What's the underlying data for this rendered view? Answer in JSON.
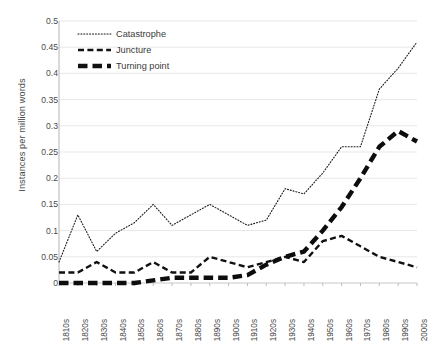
{
  "chart_data": {
    "type": "line",
    "title": "",
    "subtitle": "",
    "xlabel": "",
    "ylabel": "Instances per million words",
    "ylim": [
      0,
      0.5
    ],
    "ytick_step": 0.05,
    "grid": true,
    "grid_axis": "y",
    "legend_position": "top-left",
    "categories": [
      "1810s",
      "1820s",
      "1830s",
      "1840s",
      "1850s",
      "1860s",
      "1870s",
      "1880s",
      "1890s",
      "1900s",
      "1910s",
      "1920s",
      "1930s",
      "1940s",
      "1950s",
      "1960s",
      "1970s",
      "1980s",
      "1990s",
      "2000s"
    ],
    "ytick_labels": [
      "0",
      "0.05",
      "0.1",
      "0.15",
      "0.2",
      "0.25",
      "0.3",
      "0.35",
      "0.4",
      "0.45",
      "0.5"
    ],
    "ytick_values": [
      0,
      0.05,
      0.1,
      0.15,
      0.2,
      0.25,
      0.3,
      0.35,
      0.4,
      0.45,
      0.5
    ],
    "series": [
      {
        "name": "Catastrophe",
        "style": "dotted",
        "color": "#1a1a1a",
        "values": [
          0.04,
          0.13,
          0.06,
          0.095,
          0.115,
          0.15,
          0.11,
          0.13,
          0.15,
          0.13,
          0.11,
          0.12,
          0.18,
          0.17,
          0.21,
          0.26,
          0.26,
          0.37,
          0.41,
          0.46
        ]
      },
      {
        "name": "Juncture",
        "style": "dashed",
        "color": "#111111",
        "values": [
          0.02,
          0.02,
          0.04,
          0.02,
          0.02,
          0.04,
          0.02,
          0.02,
          0.05,
          0.04,
          0.03,
          0.04,
          0.05,
          0.04,
          0.08,
          0.09,
          0.07,
          0.05,
          0.04,
          0.03
        ]
      },
      {
        "name": "Turning point",
        "style": "thick-dashed",
        "color": "#0d0d0d",
        "values": [
          0.0,
          0.0,
          0.0,
          0.0,
          0.0,
          0.005,
          0.01,
          0.01,
          0.01,
          0.01,
          0.015,
          0.035,
          0.05,
          0.06,
          0.1,
          0.145,
          0.2,
          0.26,
          0.29,
          0.27
        ]
      }
    ],
    "legend": [
      {
        "label": "Catastrophe",
        "style": "dotted"
      },
      {
        "label": "Juncture",
        "style": "dashed"
      },
      {
        "label": "Turning point",
        "style": "thick-dashed"
      }
    ]
  }
}
